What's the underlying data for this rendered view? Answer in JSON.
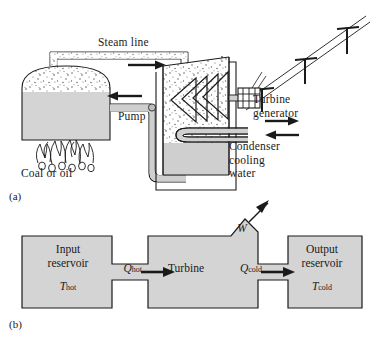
{
  "figure": {
    "panel_a_tag": "(a)",
    "panel_b_tag": "(b)",
    "accent_fill": "#d4d4d4",
    "line_color": "#1a1a1a",
    "background": "#ffffff"
  },
  "panel_a": {
    "caption": "(a)",
    "labels": {
      "steam_line": "Steam line",
      "pump": "Pump",
      "coal_or_oil": "Coal or oil",
      "turbine_generator_line1": "Turbine",
      "turbine_generator_line2": "generator",
      "condenser_line1": "Condenser",
      "condenser_line2": "cooling",
      "condenser_line3": "water"
    },
    "components": [
      "boiler",
      "steam-pipe",
      "pump-pipe",
      "turbine-housing",
      "turbine-blades",
      "generator",
      "condenser-coils",
      "transmission-line",
      "flames"
    ],
    "flow_arrows": [
      {
        "name": "steam-flow-arrow",
        "direction": "right"
      },
      {
        "name": "feedwater-flow-arrow",
        "direction": "left"
      },
      {
        "name": "cooling-water-inlet-arrow",
        "direction": "right"
      },
      {
        "name": "cooling-water-outlet-arrow",
        "direction": "left"
      }
    ],
    "transmission_towers": 3,
    "turbine_blade_count": 4
  },
  "panel_b": {
    "caption": "(b)",
    "input_reservoir_line1": "Input",
    "input_reservoir_line2": "reservoir",
    "input_temp_symbol": "T",
    "input_temp_sub": "hot",
    "turbine_label": "Turbine",
    "output_reservoir_line1": "Output",
    "output_reservoir_line2": "reservoir",
    "output_temp_symbol": "T",
    "output_temp_sub": "cold",
    "q_hot_symbol": "Q",
    "q_hot_sub": "hot",
    "q_cold_symbol": "Q",
    "q_cold_sub": "cold",
    "work_symbol": "W",
    "arrows": [
      {
        "name": "q-hot-arrow",
        "direction": "right"
      },
      {
        "name": "q-cold-arrow",
        "direction": "right"
      },
      {
        "name": "work-output-arrow",
        "direction": "up-right"
      }
    ]
  }
}
